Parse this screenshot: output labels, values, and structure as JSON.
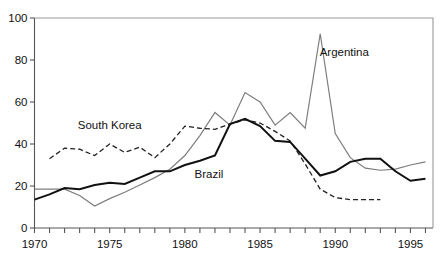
{
  "chart_data": {
    "type": "line",
    "title": "",
    "subtitle": "",
    "xlabel": "",
    "ylabel": "",
    "xlim": [
      1970,
      1996.5
    ],
    "ylim": [
      0,
      100
    ],
    "grid": false,
    "legend_position": "inline-annotations",
    "x_tick_labels": [
      "1970",
      "1975",
      "1980",
      "1985",
      "1990",
      "1995"
    ],
    "x_tick_label_values": [
      1970,
      1975,
      1980,
      1985,
      1990,
      1995
    ],
    "x_minor_ticks": [
      1970,
      1971,
      1972,
      1973,
      1974,
      1975,
      1976,
      1977,
      1978,
      1979,
      1980,
      1981,
      1982,
      1983,
      1984,
      1985,
      1986,
      1987,
      1988,
      1989,
      1990,
      1991,
      1992,
      1993,
      1994,
      1995,
      1996
    ],
    "y_tick_labels": [
      "0",
      "20",
      "40",
      "60",
      "80",
      "100"
    ],
    "y_tick_label_values": [
      0,
      20,
      40,
      60,
      80,
      100
    ],
    "series": [
      {
        "name": "Argentina",
        "style": "solid-gray",
        "color": "#7d7d7d",
        "width": 1.2,
        "label_x": 1990.6,
        "label_y": 82,
        "x": [
          1970,
          1971,
          1972,
          1973,
          1974,
          1975,
          1976,
          1977,
          1978,
          1979,
          1980,
          1981,
          1982,
          1983,
          1984,
          1985,
          1986,
          1987,
          1988,
          1989,
          1990,
          1991,
          1992,
          1993,
          1994,
          1995,
          1996
        ],
        "values": [
          18.5,
          18.5,
          18.5,
          15.5,
          10.5,
          14.0,
          17.0,
          20.5,
          24.0,
          28.0,
          34.5,
          44.0,
          55.0,
          49.0,
          64.5,
          60.0,
          49.0,
          55.0,
          47.5,
          92.5,
          45.0,
          33.5,
          28.5,
          27.5,
          28.0,
          30.0,
          31.5
        ]
      },
      {
        "name": "South Korea",
        "style": "dashed",
        "color": "#222222",
        "width": 1.3,
        "dash": "5,3",
        "label_x": 1975.0,
        "label_y": 47,
        "x": [
          1971,
          1972,
          1973,
          1974,
          1975,
          1976,
          1977,
          1978,
          1979,
          1980,
          1981,
          1982,
          1983,
          1984,
          1985,
          1986,
          1987,
          1988,
          1989,
          1990,
          1991,
          1992,
          1993
        ],
        "values": [
          33.0,
          38.0,
          37.5,
          34.5,
          40.0,
          36.0,
          38.5,
          33.5,
          40.0,
          48.5,
          47.5,
          47.0,
          49.5,
          51.5,
          50.0,
          46.0,
          41.5,
          30.5,
          18.5,
          14.5,
          13.5,
          13.5,
          13.5
        ]
      },
      {
        "name": "Brazil",
        "style": "solid-black",
        "color": "#111111",
        "width": 2.0,
        "label_x": 1981.6,
        "label_y": 24,
        "x": [
          1970,
          1971,
          1972,
          1973,
          1974,
          1975,
          1976,
          1977,
          1978,
          1979,
          1980,
          1981,
          1982,
          1983,
          1984,
          1985,
          1986,
          1987,
          1988,
          1989,
          1990,
          1991,
          1992,
          1993,
          1994,
          1995,
          1996
        ],
        "values": [
          13.5,
          16.0,
          19.0,
          18.5,
          20.5,
          21.5,
          21.0,
          24.0,
          27.0,
          27.0,
          30.0,
          32.0,
          34.5,
          49.5,
          52.0,
          48.5,
          41.5,
          41.0,
          33.0,
          25.0,
          27.0,
          31.5,
          33.0,
          33.0,
          27.0,
          22.5,
          23.5
        ]
      }
    ]
  }
}
